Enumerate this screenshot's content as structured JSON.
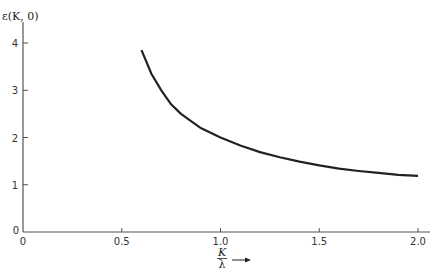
{
  "chart_data": {
    "type": "line",
    "title": "",
    "ylabel": "ε(K, 0)",
    "xlabel": "K/λ",
    "xlim": [
      0,
      2.05
    ],
    "ylim": [
      0,
      4.4
    ],
    "x_ticks": [
      "0",
      "0.5",
      "1.0",
      "1.5",
      "2.0"
    ],
    "y_ticks": [
      "0",
      "1",
      "2",
      "3",
      "4"
    ],
    "grid": false,
    "series": [
      {
        "name": "ε(K, 0)",
        "x": [
          0.6,
          0.65,
          0.7,
          0.75,
          0.8,
          0.9,
          1.0,
          1.1,
          1.2,
          1.3,
          1.4,
          1.5,
          1.6,
          1.7,
          1.8,
          1.9,
          2.0
        ],
        "y": [
          3.85,
          3.35,
          3.0,
          2.7,
          2.5,
          2.2,
          2.0,
          1.83,
          1.69,
          1.58,
          1.49,
          1.41,
          1.34,
          1.29,
          1.25,
          1.21,
          1.19
        ]
      }
    ]
  },
  "axes": {
    "y_label": "ε(K, 0)",
    "x_label_num": "K",
    "x_label_den": "λ",
    "origin_y": "0",
    "origin_x": "0"
  }
}
